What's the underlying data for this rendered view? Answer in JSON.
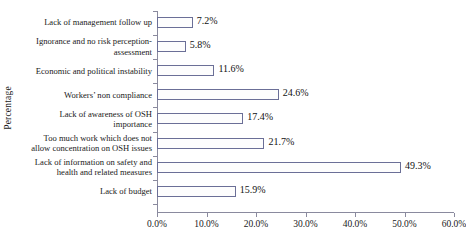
{
  "chart_data": {
    "type": "bar",
    "orientation": "horizontal",
    "title": "",
    "xlabel": "",
    "ylabel": "Percentage",
    "xlim": [
      0,
      60
    ],
    "grid": false,
    "legend": null,
    "xticks": [
      "0.0%",
      "10.0%",
      "20.0%",
      "30.0%",
      "40.0%",
      "50.0%",
      "60.0%"
    ],
    "xtick_values": [
      0,
      10,
      20,
      30,
      40,
      50,
      60
    ],
    "categories": [
      "Lack of management follow up",
      "Ignorance and no risk perception-assessment",
      "Economic and political instability",
      "Workers’ non compliance",
      "Lack of awareness of OSH importance",
      "Too much work which does not allow concentration on OSH issues",
      "Lack of information on safety and health and related measures",
      "Lack of budget"
    ],
    "category_lines": [
      [
        "Lack of management follow up"
      ],
      [
        "Ignorance and no risk perception-",
        "assessment"
      ],
      [
        "Economic and political instability"
      ],
      [
        "Workers’ non compliance"
      ],
      [
        "Lack of awareness of OSH",
        "importance"
      ],
      [
        "Too much work which does not",
        "allow concentration on OSH issues"
      ],
      [
        "Lack of information on safety and",
        "health and related measures"
      ],
      [
        "Lack of budget"
      ]
    ],
    "values": [
      7.2,
      5.8,
      11.6,
      24.6,
      17.4,
      21.7,
      49.3,
      15.9
    ],
    "value_labels": [
      "7.2%",
      "5.8%",
      "11.6%",
      "24.6%",
      "17.4%",
      "21.7%",
      "49.3%",
      "15.9%"
    ],
    "colors": {
      "bar_fill": "#fdfdfd",
      "bar_border": "#6b6f97",
      "axis": "#8a8a9e",
      "text": "#1a1a1a"
    }
  }
}
